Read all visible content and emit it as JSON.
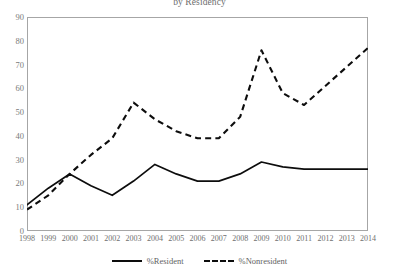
{
  "chart_data": {
    "type": "line",
    "title": "by Residency",
    "xlabel": "",
    "ylabel": "",
    "ylim": [
      0,
      90
    ],
    "ytick_step": 10,
    "grid": false,
    "legend_position": "bottom",
    "x": [
      1998,
      1999,
      2000,
      2001,
      2002,
      2003,
      2004,
      2005,
      2006,
      2007,
      2008,
      2009,
      2010,
      2011,
      2012,
      2013,
      2014
    ],
    "categories": [
      "1998",
      "1999",
      "2000",
      "2001",
      "2002",
      "2003",
      "2004",
      "2005",
      "2006",
      "2007",
      "2008",
      "2009",
      "2010",
      "2011",
      "2012",
      "2013",
      "2014"
    ],
    "yticks": [
      "0",
      "10",
      "20",
      "30",
      "40",
      "50",
      "60",
      "70",
      "80",
      "90"
    ],
    "series": [
      {
        "name": "%Resident",
        "style": "solid",
        "color": "#0d0d0d",
        "values": [
          11,
          18,
          24,
          19,
          15,
          21,
          28,
          24,
          21,
          21,
          24,
          29,
          27,
          26,
          26,
          26,
          26
        ]
      },
      {
        "name": "%Nonresident",
        "style": "dashed",
        "color": "#0d0d0d",
        "values": [
          9,
          15,
          24,
          32,
          39,
          54,
          47,
          42,
          39,
          39,
          48,
          76,
          58,
          53,
          61,
          69,
          77
        ]
      }
    ]
  },
  "legend": {
    "entries": [
      {
        "label": "%Resident"
      },
      {
        "label": "%Nonresident"
      }
    ]
  }
}
